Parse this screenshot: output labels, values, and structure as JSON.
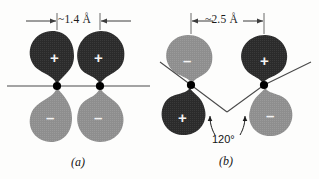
{
  "figure": {
    "background_color": "#fdfdfc",
    "lobe_dark_color": "#2b2b2b",
    "lobe_light_color": "#8e8e8e",
    "line_color": "#4a4a4a",
    "nucleus_color": "#000000",
    "sign_color": "#f4f4f4"
  },
  "panels": [
    {
      "id": "a",
      "caption": "(a)",
      "dimension_label": "~1.4 Å",
      "dimension_value": 1.4,
      "dimension_unit": "Å",
      "dimension_arrow_style": "outside-in",
      "axis_type": "straight-horizontal",
      "nuclei": [
        {
          "x": 57,
          "y": 86
        },
        {
          "x": 100,
          "y": 86
        }
      ],
      "lobes": [
        {
          "sign": "+",
          "shade": "dark",
          "position": "upper-left",
          "points": "up-wide-down-tip"
        },
        {
          "sign": "+",
          "shade": "dark",
          "position": "upper-right",
          "points": "up-wide-down-tip"
        },
        {
          "sign": "-",
          "shade": "light",
          "position": "lower-left",
          "points": "down-wide-up-tip"
        },
        {
          "sign": "-",
          "shade": "light",
          "position": "lower-right",
          "points": "down-wide-up-tip"
        }
      ]
    },
    {
      "id": "b",
      "caption": "(b)",
      "dimension_label": "~2.5 Å",
      "dimension_value": 2.5,
      "dimension_unit": "Å",
      "dimension_arrow_style": "inside-out",
      "axis_type": "bent-v",
      "angle_label": "120°",
      "angle_value": 120,
      "nuclei": [
        {
          "x": 191,
          "y": 85
        },
        {
          "x": 264,
          "y": 85
        }
      ],
      "lobes": [
        {
          "sign": "-",
          "shade": "light",
          "position": "upper-left",
          "points": "up-wide-down-tip"
        },
        {
          "sign": "+",
          "shade": "dark",
          "position": "upper-right",
          "points": "up-wide-down-tip"
        },
        {
          "sign": "+",
          "shade": "dark",
          "position": "lower-left",
          "points": "down-wide-up-tip"
        },
        {
          "sign": "-",
          "shade": "light",
          "position": "lower-right",
          "points": "down-wide-up-tip"
        }
      ]
    }
  ],
  "signs": {
    "plus": "+",
    "minus": "–"
  }
}
